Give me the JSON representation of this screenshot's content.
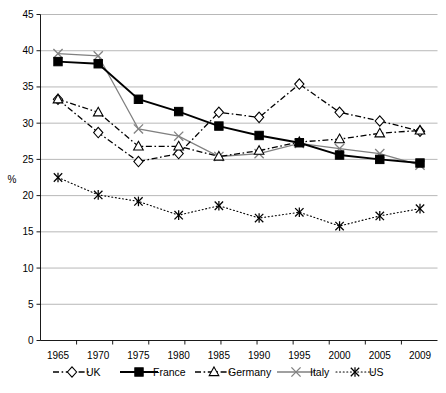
{
  "chart_data": {
    "type": "line",
    "title": "",
    "subtitle": "",
    "xlabel": "",
    "ylabel": "%",
    "ylim": [
      0,
      45
    ],
    "ytick_step": 5,
    "yticks": [
      0,
      5,
      10,
      15,
      20,
      25,
      30,
      35,
      40,
      45
    ],
    "grid": true,
    "legend_position": "bottom",
    "categories": [
      "1965",
      "1970",
      "1975",
      "1980",
      "1985",
      "1990",
      "1995",
      "2000",
      "2005",
      "2009"
    ],
    "x": [
      1965,
      1970,
      1975,
      1980,
      1985,
      1990,
      1995,
      2000,
      2005,
      2009
    ],
    "series": [
      {
        "name": "UK",
        "marker": "open-diamond",
        "line": "dash-dot",
        "color": "#000000",
        "values": [
          33.3,
          28.7,
          24.7,
          25.8,
          31.5,
          30.8,
          35.4,
          31.5,
          30.3,
          28.9
        ]
      },
      {
        "name": "France",
        "marker": "filled-square",
        "line": "solid",
        "color": "#000000",
        "values": [
          38.5,
          38.2,
          33.3,
          31.6,
          29.6,
          28.3,
          27.3,
          25.6,
          25.0,
          24.5
        ]
      },
      {
        "name": "Germany",
        "marker": "open-triangle",
        "line": "dash-dot",
        "color": "#000000",
        "values": [
          33.3,
          31.5,
          26.8,
          26.8,
          25.4,
          26.2,
          27.4,
          27.8,
          28.6,
          29.0
        ]
      },
      {
        "name": "Italy",
        "marker": "cross-x",
        "line": "solid",
        "color": "#808080",
        "values": [
          39.6,
          39.3,
          29.2,
          28.2,
          25.4,
          25.8,
          27.2,
          26.5,
          25.8,
          24.2
        ]
      },
      {
        "name": "US",
        "marker": "asterisk",
        "line": "dotted",
        "color": "#000000",
        "values": [
          22.5,
          20.1,
          19.2,
          17.3,
          18.6,
          16.9,
          17.7,
          15.8,
          17.2,
          18.2
        ]
      }
    ]
  },
  "legend": {
    "items": [
      {
        "label": "UK"
      },
      {
        "label": "France"
      },
      {
        "label": "Germany"
      },
      {
        "label": "Italy"
      },
      {
        "label": "US"
      }
    ]
  }
}
